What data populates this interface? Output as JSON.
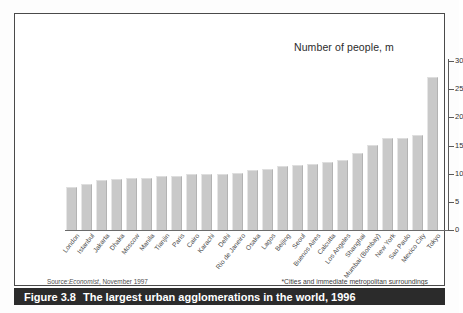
{
  "figure": {
    "caption_number": "Figure 3.8",
    "caption_text": "The largest urban agglomerations in the world, 1996",
    "source_prefix": "Source:",
    "source_italic": "Economist",
    "source_suffix": ", November 1997",
    "footnote": "*Cities and immediate metropolitan surroundings",
    "axis_title": "Number of people, m"
  },
  "colors": {
    "bar_fill": "#c9c9c9",
    "bar_edge_light": "#e6e6e6",
    "bar_edge_dark": "#b3b3b3",
    "axis": "#5a5a5a",
    "caption_bar": "#2b2b2b",
    "caption_text": "#ffffff",
    "frame": "#4a4a4a",
    "page": "#ffffff"
  },
  "chart_data": {
    "type": "bar",
    "title": "The largest urban agglomerations in the world, 1996",
    "xlabel": "",
    "ylabel": "Number of people, m",
    "ylim": [
      0,
      30
    ],
    "yticks": [
      0,
      5,
      10,
      15,
      20,
      25,
      30
    ],
    "grid": false,
    "legend": "none",
    "orientation": "vertical",
    "categories": [
      "London",
      "Istanbul",
      "Jakarta",
      "Dhaka",
      "Moscow",
      "Manila",
      "Tianjin",
      "Paris",
      "Cairo",
      "Karachi",
      "Delhi",
      "Rio de Janeiro",
      "Osaka",
      "Lagos",
      "Beijing",
      "Seoul",
      "Buenos Aires",
      "Calcutta",
      "Los Angeles",
      "Shanghai",
      "Mumbai (Bombay)",
      "New York",
      "Sao Paulo",
      "Mexico City",
      "Tokyo"
    ],
    "values": [
      7.6,
      8.2,
      8.8,
      9.0,
      9.2,
      9.3,
      9.6,
      9.6,
      9.9,
      9.9,
      10.0,
      10.2,
      10.6,
      10.9,
      11.3,
      11.6,
      11.8,
      12.0,
      12.4,
      13.7,
      15.1,
      16.3,
      16.4,
      16.9,
      27.2
    ],
    "annotations": [
      "*Cities and immediate metropolitan surroundings"
    ]
  }
}
